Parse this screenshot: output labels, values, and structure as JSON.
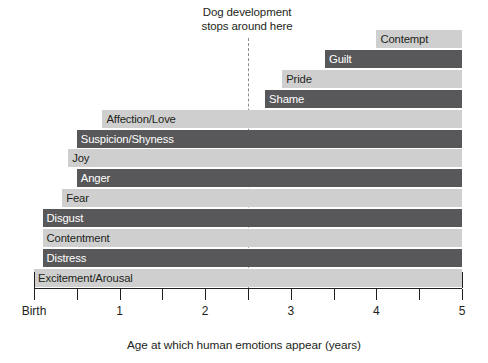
{
  "chart_data": {
    "type": "bar",
    "orientation": "horizontal",
    "title": "",
    "xlabel": "Age at which human emotions appear (years)",
    "ylabel": "",
    "xlim": [
      0,
      5
    ],
    "xticks": [
      0,
      0.5,
      1,
      1.5,
      2,
      2.5,
      3,
      3.5,
      4,
      4.5,
      5
    ],
    "xticklabels": [
      "Birth",
      "",
      "1",
      "",
      "2",
      "",
      "3",
      "",
      "4",
      "",
      "5"
    ],
    "grid": false,
    "legend": null,
    "annotations": [
      {
        "text": "Dog development\nstops around here",
        "x": 2.5,
        "marker": "dashed-vertical-line"
      }
    ],
    "bars": [
      {
        "label": "Contempt",
        "start": 4.0,
        "end": 5.0,
        "shade": "light"
      },
      {
        "label": "Guilt",
        "start": 3.4,
        "end": 5.0,
        "shade": "dark"
      },
      {
        "label": "Pride",
        "start": 2.9,
        "end": 5.0,
        "shade": "light"
      },
      {
        "label": "Shame",
        "start": 2.7,
        "end": 5.0,
        "shade": "dark"
      },
      {
        "label": "Affection/Love",
        "start": 0.8,
        "end": 5.0,
        "shade": "light"
      },
      {
        "label": "Suspicion/Shyness",
        "start": 0.5,
        "end": 5.0,
        "shade": "dark"
      },
      {
        "label": "Joy",
        "start": 0.4,
        "end": 5.0,
        "shade": "light"
      },
      {
        "label": "Anger",
        "start": 0.5,
        "end": 5.0,
        "shade": "dark"
      },
      {
        "label": "Fear",
        "start": 0.33,
        "end": 5.0,
        "shade": "light"
      },
      {
        "label": "Disgust",
        "start": 0.1,
        "end": 5.0,
        "shade": "dark"
      },
      {
        "label": "Contentment",
        "start": 0.1,
        "end": 5.0,
        "shade": "light"
      },
      {
        "label": "Distress",
        "start": 0.1,
        "end": 5.0,
        "shade": "dark"
      },
      {
        "label": "Excitement/Arousal",
        "start": 0.0,
        "end": 5.0,
        "shade": "light"
      }
    ]
  },
  "labels": {
    "annotation_note": "Dog development\nstops around here",
    "axis_title": "Age at which human emotions appear (years)",
    "tick_birth": "Birth",
    "tick_1": "1",
    "tick_2": "2",
    "tick_3": "3",
    "tick_4": "4",
    "tick_5": "5"
  },
  "colors": {
    "light_bar": "#cfcfcf",
    "dark_bar": "#58585a",
    "axis": "#231f20",
    "marker": "#8b8b8b",
    "background": "#ffffff"
  }
}
